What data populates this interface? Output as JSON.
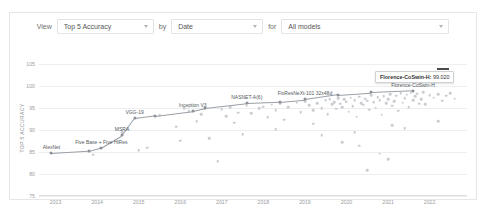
{
  "toolbar": {
    "view_label": "View",
    "by_label": "by",
    "for_label": "for",
    "metric_value": "Top 5 Accuracy",
    "axis_value": "Date",
    "filter_value": "All models",
    "caret_icon": "chevron-down-icon"
  },
  "tooltip": {
    "text": "Florence-CoSwin-H: 99.020",
    "model": "Florence-CoSwin-H",
    "value": "99.020"
  },
  "chart_data": {
    "type": "scatter",
    "title": "",
    "xlabel": "",
    "ylabel": "TOP 5 ACCURACY",
    "xlim": [
      2012.6,
      2022.9
    ],
    "ylim": [
      75,
      106
    ],
    "yticks": [
      75,
      80,
      85,
      90,
      95,
      100,
      105
    ],
    "xticks": [
      2013,
      2014,
      2015,
      2016,
      2017,
      2018,
      2019,
      2020,
      2021,
      2022
    ],
    "grid": true,
    "legend": "none",
    "colors": {
      "point": "#c9ccd0",
      "sota_line": "#9aa0a6",
      "grid": "#eceef0"
    },
    "series": [
      {
        "name": "State-of-the-art frontier",
        "type": "line",
        "annotated": true,
        "points": [
          {
            "x": 2012.9,
            "y": 84.7,
            "label": "AlexNet"
          },
          {
            "x": 2013.8,
            "y": 85.2,
            "label": ""
          },
          {
            "x": 2014.1,
            "y": 86.0,
            "label": "Five Base + Five HiRes"
          },
          {
            "x": 2014.6,
            "y": 88.8,
            "label": "MSRA"
          },
          {
            "x": 2014.9,
            "y": 92.7,
            "label": "VGG-19"
          },
          {
            "x": 2015.4,
            "y": 93.3,
            "label": ""
          },
          {
            "x": 2016.3,
            "y": 94.4,
            "label": "Inception V3"
          },
          {
            "x": 2016.6,
            "y": 95.1,
            "label": ""
          },
          {
            "x": 2017.6,
            "y": 96.2,
            "label": "NASNET-A(6)"
          },
          {
            "x": 2018.4,
            "y": 96.5,
            "label": ""
          },
          {
            "x": 2019.0,
            "y": 97.0,
            "label": "FixResNeXt-101 32x48d"
          },
          {
            "x": 2019.8,
            "y": 98.1,
            "label": ""
          },
          {
            "x": 2020.6,
            "y": 98.6,
            "label": ""
          },
          {
            "x": 2021.6,
            "y": 99.0,
            "label": "Florence-CoSwin-H"
          }
        ]
      },
      {
        "name": "All models",
        "type": "scatter",
        "points": [
          [
            2013.9,
            84.4
          ],
          [
            2014.6,
            89.5
          ],
          [
            2015.2,
            86.0
          ],
          [
            2015.5,
            93.4
          ],
          [
            2015.9,
            90.8
          ],
          [
            2016.1,
            95.0
          ],
          [
            2016.2,
            94.3
          ],
          [
            2016.4,
            92.1
          ],
          [
            2016.5,
            93.6
          ],
          [
            2016.6,
            95.1
          ],
          [
            2016.7,
            88.2
          ],
          [
            2016.9,
            82.9
          ],
          [
            2017.0,
            94.8
          ],
          [
            2017.1,
            93.2
          ],
          [
            2017.2,
            95.2
          ],
          [
            2017.3,
            91.7
          ],
          [
            2017.4,
            94.0
          ],
          [
            2017.6,
            95.6
          ],
          [
            2017.7,
            93.9
          ],
          [
            2017.9,
            95.0
          ],
          [
            2018.0,
            95.4
          ],
          [
            2018.1,
            93.0
          ],
          [
            2018.2,
            95.8
          ],
          [
            2018.3,
            94.6
          ],
          [
            2018.4,
            96.0
          ],
          [
            2018.5,
            92.4
          ],
          [
            2018.6,
            95.3
          ],
          [
            2018.8,
            96.3
          ],
          [
            2018.9,
            94.1
          ],
          [
            2019.0,
            96.6
          ],
          [
            2019.1,
            95.7
          ],
          [
            2019.2,
            94.5
          ],
          [
            2019.3,
            96.1
          ],
          [
            2019.4,
            95.0
          ],
          [
            2019.5,
            96.8
          ],
          [
            2019.55,
            93.7
          ],
          [
            2019.6,
            97.1
          ],
          [
            2019.65,
            95.9
          ],
          [
            2019.7,
            96.4
          ],
          [
            2019.75,
            94.9
          ],
          [
            2019.8,
            97.3
          ],
          [
            2019.85,
            96.0
          ],
          [
            2019.9,
            95.2
          ],
          [
            2019.95,
            97.0
          ],
          [
            2020.0,
            96.5
          ],
          [
            2020.05,
            94.2
          ],
          [
            2020.1,
            97.4
          ],
          [
            2020.15,
            95.5
          ],
          [
            2020.2,
            96.9
          ],
          [
            2020.25,
            93.1
          ],
          [
            2020.3,
            97.6
          ],
          [
            2020.35,
            96.2
          ],
          [
            2020.4,
            95.8
          ],
          [
            2020.45,
            97.2
          ],
          [
            2020.5,
            96.7
          ],
          [
            2020.55,
            94.7
          ],
          [
            2020.6,
            98.0
          ],
          [
            2020.65,
            96.4
          ],
          [
            2020.7,
            95.1
          ],
          [
            2020.75,
            97.5
          ],
          [
            2020.8,
            96.8
          ],
          [
            2020.85,
            93.5
          ],
          [
            2020.9,
            97.8
          ],
          [
            2020.95,
            96.1
          ],
          [
            2021.0,
            97.0
          ],
          [
            2021.05,
            98.2
          ],
          [
            2021.1,
            95.6
          ],
          [
            2021.15,
            96.6
          ],
          [
            2021.2,
            97.9
          ],
          [
            2021.25,
            94.4
          ],
          [
            2021.3,
            98.4
          ],
          [
            2021.35,
            96.3
          ],
          [
            2021.4,
            97.3
          ],
          [
            2021.45,
            98.1
          ],
          [
            2021.5,
            95.3
          ],
          [
            2021.55,
            98.5
          ],
          [
            2021.6,
            96.9
          ],
          [
            2021.65,
            97.7
          ],
          [
            2021.7,
            98.3
          ],
          [
            2021.75,
            96.0
          ],
          [
            2021.8,
            97.1
          ],
          [
            2021.85,
            98.6
          ],
          [
            2021.9,
            95.9
          ],
          [
            2022.0,
            98.0
          ],
          [
            2022.1,
            97.4
          ],
          [
            2022.2,
            98.2
          ],
          [
            2022.3,
            96.7
          ],
          [
            2022.4,
            97.9
          ],
          [
            2022.5,
            98.4
          ],
          [
            2022.6,
            97.2
          ],
          [
            2020.2,
            89.6
          ],
          [
            2020.3,
            86.5
          ],
          [
            2019.4,
            88.9
          ],
          [
            2021.1,
            91.2
          ],
          [
            2020.8,
            84.6
          ],
          [
            2018.3,
            90.2
          ],
          [
            2017.5,
            89.1
          ],
          [
            2019.9,
            87.3
          ],
          [
            2021.4,
            90.5
          ],
          [
            2022.2,
            92.0
          ],
          [
            2016.0,
            87.6
          ],
          [
            2015.0,
            85.4
          ],
          [
            2020.5,
            80.9
          ],
          [
            2021.0,
            83.4
          ],
          [
            2019.2,
            91.5
          ]
        ]
      }
    ]
  }
}
